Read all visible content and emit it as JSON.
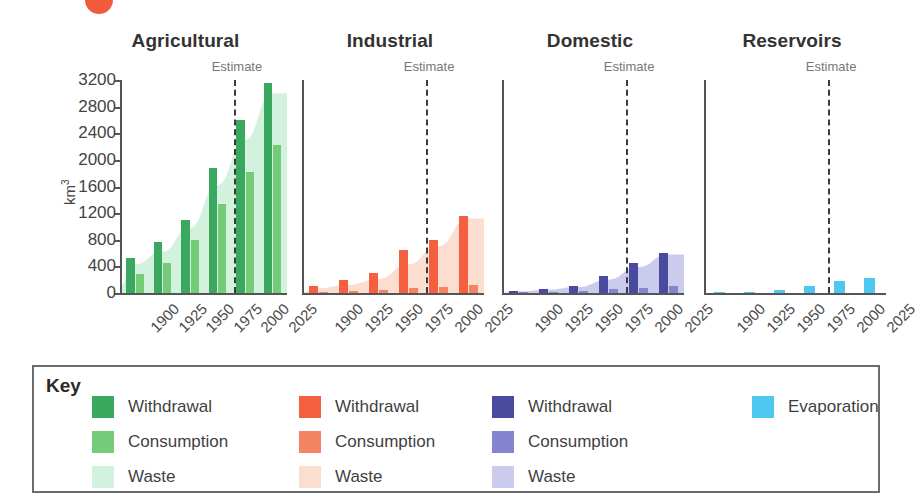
{
  "figure": {
    "marker_dot_color": "#ef5b3c",
    "y_axis_title": "km",
    "y_axis_title_sup": "3",
    "estimate_label": "Estimate",
    "key_label": "Key"
  },
  "chart_data": {
    "type": "bar",
    "xlabel": "",
    "ylabel": "km3",
    "ylim": [
      0,
      3200
    ],
    "yticks": [
      0,
      400,
      800,
      1200,
      1600,
      2000,
      2400,
      2800,
      3200
    ],
    "ytick_labels": [
      "0",
      "400",
      "800",
      "1200",
      "1600",
      "2000",
      "2400",
      "2800",
      "3200"
    ],
    "categories": [
      "1900",
      "1925",
      "1950",
      "1975",
      "2000",
      "2025"
    ],
    "grid": false,
    "legend_position": "bottom",
    "annotations": [
      {
        "text": "Estimate",
        "note": "dashed vertical line between 2000 and 1975 marking start of projected values, shown in every panel"
      }
    ],
    "panels": [
      {
        "name": "Agricultural",
        "title": "Agricultural",
        "colors": {
          "withdrawal": "#3aa85e",
          "consumption": "#74cc78",
          "waste": "#d3f2dd"
        },
        "series": [
          {
            "name": "Withdrawal",
            "values": [
              525,
              760,
              1090,
              1880,
              2600,
              3160
            ]
          },
          {
            "name": "Consumption",
            "values": [
              285,
              455,
              795,
              1340,
              1820,
              2230
            ]
          },
          {
            "name": "Waste",
            "values": [
              430,
              620,
              980,
              1620,
              2300,
              3000
            ]
          }
        ]
      },
      {
        "name": "Industrial",
        "title": "Industrial",
        "colors": {
          "withdrawal": "#f4603f",
          "consumption": "#f58464",
          "waste": "#fbded0"
        },
        "series": [
          {
            "name": "Withdrawal",
            "values": [
              100,
              195,
              300,
              650,
              800,
              1150
            ]
          },
          {
            "name": "Consumption",
            "values": [
              20,
              35,
              45,
              70,
              95,
              125
            ]
          },
          {
            "name": "Waste",
            "values": [
              70,
              120,
              210,
              430,
              700,
              1120
            ]
          }
        ]
      },
      {
        "name": "Domestic",
        "title": "Domestic",
        "colors": {
          "withdrawal": "#4a4a9e",
          "consumption": "#8585cf",
          "waste": "#cbcbee"
        },
        "series": [
          {
            "name": "Withdrawal",
            "values": [
              30,
              65,
              105,
              250,
              450,
              600
            ]
          },
          {
            "name": "Consumption",
            "values": [
              10,
              18,
              28,
              55,
              80,
              100
            ]
          },
          {
            "name": "Waste",
            "values": [
              25,
              50,
              90,
              200,
              390,
              580
            ]
          }
        ]
      },
      {
        "name": "Reservoirs",
        "title": "Reservoirs",
        "colors": {
          "evaporation": "#4ec8f0"
        },
        "series": [
          {
            "name": "Evaporation",
            "values": [
              10,
              22,
              40,
              110,
              185,
              225
            ]
          }
        ]
      }
    ]
  },
  "key": {
    "label": "Key",
    "columns": [
      {
        "name": "agricultural-key",
        "items": [
          {
            "label": "Withdrawal",
            "color": "#3aa85e"
          },
          {
            "label": "Consumption",
            "color": "#74cc78"
          },
          {
            "label": "Waste",
            "color": "#d3f2dd"
          }
        ]
      },
      {
        "name": "industrial-key",
        "items": [
          {
            "label": "Withdrawal",
            "color": "#f4603f"
          },
          {
            "label": "Consumption",
            "color": "#f58464"
          },
          {
            "label": "Waste",
            "color": "#fbded0"
          }
        ]
      },
      {
        "name": "domestic-key",
        "items": [
          {
            "label": "Withdrawal",
            "color": "#4a4a9e"
          },
          {
            "label": "Consumption",
            "color": "#8585cf"
          },
          {
            "label": "Waste",
            "color": "#cbcbee"
          }
        ]
      },
      {
        "name": "reservoirs-key",
        "items": [
          {
            "label": "Evaporation",
            "color": "#4ec8f0"
          }
        ]
      }
    ]
  }
}
